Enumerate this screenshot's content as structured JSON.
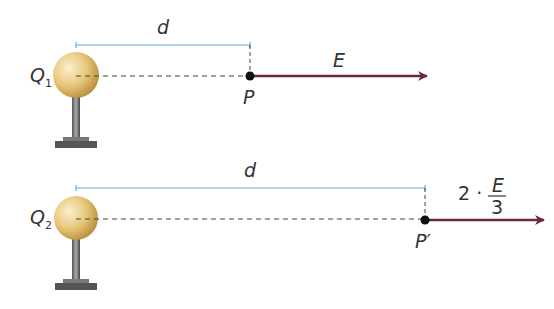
{
  "diagram": {
    "colors": {
      "distance_line": "#5ab4e0",
      "field_arrow": "#6b2a3a",
      "dashed_line": "#444444",
      "sphere": "#e8c77a",
      "stand": "#666666"
    },
    "top": {
      "charge_label": "Q",
      "charge_subscript": "1",
      "distance_label": "d",
      "point_label": "P",
      "field_label": "E"
    },
    "bottom": {
      "charge_label": "Q",
      "charge_subscript": "2",
      "distance_label": "d",
      "point_label": "P′",
      "field_coefficient": "2 ·",
      "field_numerator": "E",
      "field_denominator": "3"
    }
  }
}
